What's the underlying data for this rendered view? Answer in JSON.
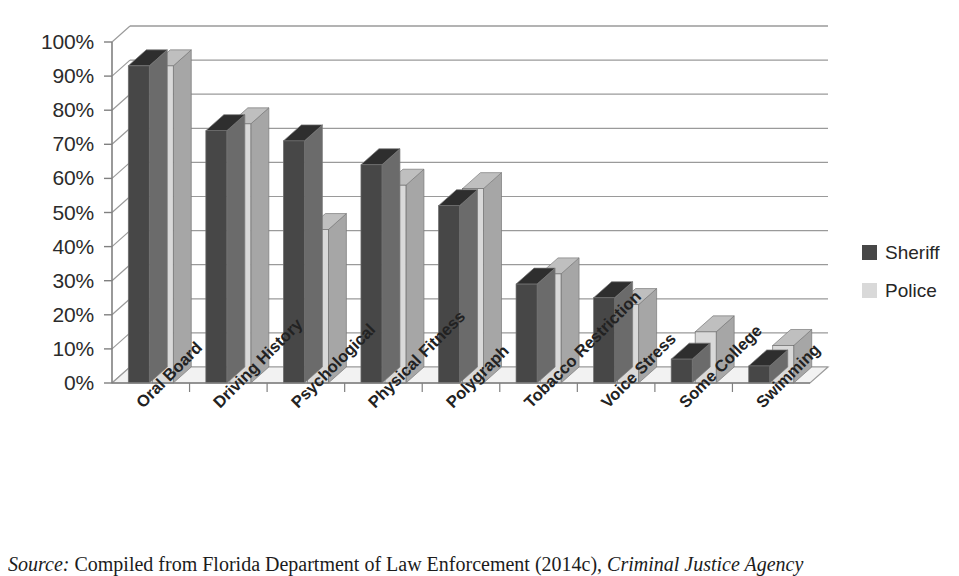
{
  "chart_data": {
    "type": "bar",
    "title": "",
    "xlabel": "",
    "ylabel": "",
    "ylim": [
      0,
      100
    ],
    "yticks": [
      0,
      10,
      20,
      30,
      40,
      50,
      60,
      70,
      80,
      90,
      100
    ],
    "ytick_labels": [
      "0%",
      "10%",
      "20%",
      "30%",
      "40%",
      "50%",
      "60%",
      "70%",
      "80%",
      "90%",
      "100%"
    ],
    "grid": true,
    "legend_position": "right",
    "three_d": true,
    "categories": [
      "Oral Board",
      "Driving History",
      "Psychological",
      "Physical Fitness",
      "Polygraph",
      "Tobacco Restriction",
      "Voice Stress",
      "Some College",
      "Swimming"
    ],
    "series": [
      {
        "name": "Sheriff",
        "color": "#474747",
        "values": [
          93,
          74,
          71,
          64,
          52,
          29,
          25,
          7,
          5
        ]
      },
      {
        "name": "Police",
        "color": "#d9d9d9",
        "values": [
          93,
          76,
          45,
          58,
          57,
          32,
          23,
          15,
          11
        ]
      }
    ]
  },
  "legend": {
    "items": [
      {
        "label": "Sheriff",
        "color": "#474747"
      },
      {
        "label": "Police",
        "color": "#d9d9d9"
      }
    ]
  },
  "caption": {
    "source_prefix": "Source:",
    "source_body": " Compiled from Florida Department of Law Enforcement (2014c), ",
    "source_italic": "Criminal Justice Agency"
  },
  "colors": {
    "bar_dark": "#474747",
    "bar_dark_top": "#2e2e2e",
    "bar_dark_side": "#6b6b6b",
    "bar_light": "#d9d9d9",
    "bar_light_top": "#bfbfbf",
    "bar_light_side": "#a6a6a6",
    "gridline": "#9a9a9a",
    "axis": "#808080",
    "floor": "#f2f2f2",
    "text": "#262626"
  }
}
